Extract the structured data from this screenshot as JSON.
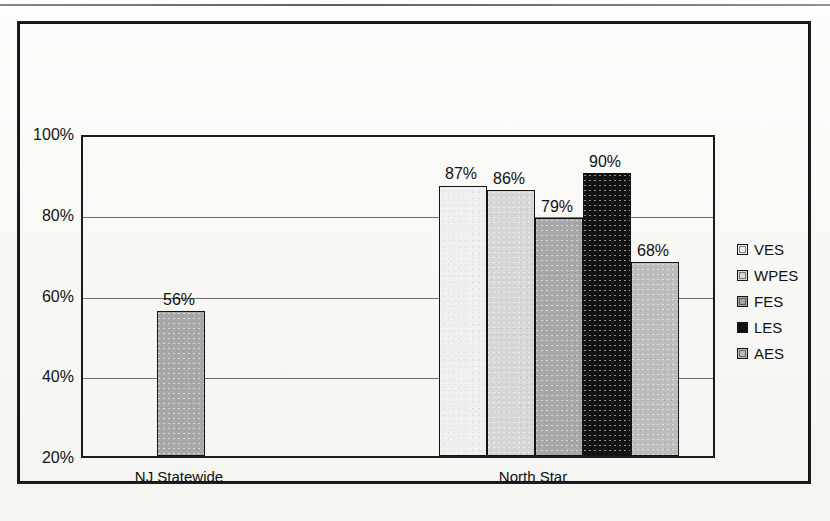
{
  "chart_data": {
    "type": "bar",
    "title": "",
    "xlabel": "",
    "ylabel": "",
    "ylim": [
      20,
      100
    ],
    "ytick_labels": [
      "100%",
      "80%",
      "60%",
      "40%",
      "20%"
    ],
    "ytick_values": [
      100,
      80,
      60,
      40,
      20
    ],
    "grid": true,
    "legend_position": "right",
    "categories": [
      "NJ Statewide",
      "North Star"
    ],
    "series": [
      {
        "name": "VES",
        "color": "#efefef",
        "values": [
          null,
          87
        ]
      },
      {
        "name": "WPES",
        "color": "#d7d7d7",
        "values": [
          null,
          86
        ]
      },
      {
        "name": "FES",
        "color": "#a8a8a8",
        "values": [
          56,
          79
        ]
      },
      {
        "name": "LES",
        "color": "#121212",
        "values": [
          null,
          90
        ]
      },
      {
        "name": "AES",
        "color": "#bdbdbd",
        "values": [
          null,
          68
        ]
      }
    ],
    "bars": [
      {
        "group": "NJ Statewide",
        "series": "FES",
        "value": 56,
        "label": "56%",
        "color": "#a8a8a8"
      },
      {
        "group": "North Star",
        "series": "VES",
        "value": 87,
        "label": "87%",
        "color": "#efefef"
      },
      {
        "group": "North Star",
        "series": "WPES",
        "value": 86,
        "label": "86%",
        "color": "#d7d7d7"
      },
      {
        "group": "North Star",
        "series": "FES",
        "value": 79,
        "label": "79%",
        "color": "#a8a8a8"
      },
      {
        "group": "North Star",
        "series": "LES",
        "value": 90,
        "label": "90%",
        "color": "#121212"
      },
      {
        "group": "North Star",
        "series": "AES",
        "value": 68,
        "label": "68%",
        "color": "#bdbdbd"
      }
    ]
  },
  "legend": {
    "items": [
      {
        "label": "VES",
        "color": "#efefef"
      },
      {
        "label": "WPES",
        "color": "#d7d7d7"
      },
      {
        "label": "FES",
        "color": "#a8a8a8"
      },
      {
        "label": "LES",
        "color": "#121212"
      },
      {
        "label": "AES",
        "color": "#bdbdbd"
      }
    ]
  },
  "axis": {
    "y_ticks": [
      "100%",
      "80%",
      "60%",
      "40%",
      "20%"
    ]
  },
  "categories": {
    "items": [
      "NJ Statewide",
      "North Star"
    ]
  },
  "background_text": {
    "line1": "",
    "line2": "",
    "line3": "",
    "line4": "",
    "line5": "",
    "line6": ""
  }
}
